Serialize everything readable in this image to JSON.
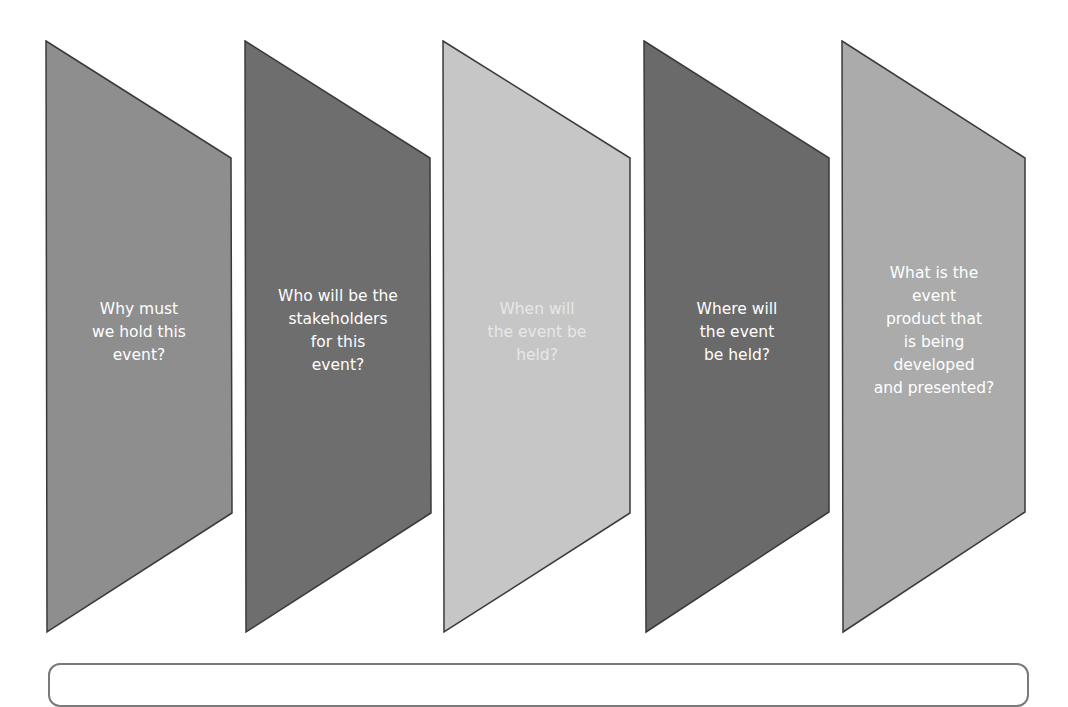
{
  "diagram": {
    "type": "chevron-steps",
    "steps": [
      {
        "label": "Why must\nwe hold this\nevent?",
        "fill": "#8e8e8e"
      },
      {
        "label": "Who will be the\nstakeholders\nfor this\nevent?",
        "fill": "#6e6e6e"
      },
      {
        "label": "When will\nthe event be\nheld?",
        "fill": "#c6c6c6"
      },
      {
        "label": "Where will\nthe event\nbe held?",
        "fill": "#6a6a6a"
      },
      {
        "label": "What is the\nevent\nproduct that\nis being\ndeveloped\nand presented?",
        "fill": "#ababab"
      }
    ],
    "outline_color": "#3a3a3a",
    "bottom_box_border": "#7a7a7a"
  }
}
